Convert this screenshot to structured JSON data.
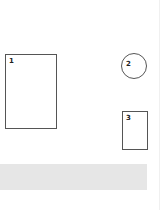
{
  "diagram": {
    "shapes": [
      {
        "id": "1",
        "label": "1",
        "type": "rectangle"
      },
      {
        "id": "2",
        "label": "2",
        "type": "circle"
      },
      {
        "id": "3",
        "label": "3",
        "type": "rectangle"
      }
    ],
    "band": {
      "type": "gray-band",
      "color": "#e6e6e6"
    },
    "colors": {
      "stroke": "#555555",
      "fill": "#ffffff",
      "background": "#ffffff"
    }
  }
}
